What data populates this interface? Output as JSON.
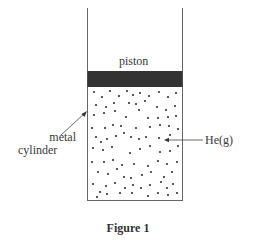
{
  "figure": {
    "caption": "Figure 1",
    "labels": {
      "piston": "piston",
      "cylinder_line1": "metal",
      "cylinder_line2": "cylinder",
      "gas": "He(g)"
    },
    "colors": {
      "wall": "#555555",
      "piston": "#333333",
      "particle": "#333333"
    }
  }
}
